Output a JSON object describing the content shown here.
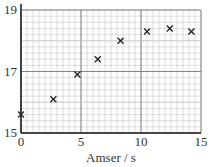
{
  "chart_data": {
    "type": "scatter",
    "title": "",
    "xlabel": "Amser / s",
    "ylabel": "",
    "xlim": [
      0,
      15
    ],
    "ylim": [
      15,
      19
    ],
    "x_ticks": [
      0,
      5,
      10,
      15
    ],
    "y_ticks": [
      15,
      17,
      19
    ],
    "grid": true,
    "legend": null,
    "marker": "x",
    "series": [
      {
        "name": "data",
        "points": [
          {
            "x": 0.0,
            "y": 15.6
          },
          {
            "x": 2.7,
            "y": 16.1
          },
          {
            "x": 4.7,
            "y": 16.9
          },
          {
            "x": 6.4,
            "y": 17.4
          },
          {
            "x": 8.3,
            "y": 18.0
          },
          {
            "x": 10.5,
            "y": 18.3
          },
          {
            "x": 12.4,
            "y": 18.4
          },
          {
            "x": 14.2,
            "y": 18.3
          }
        ]
      }
    ]
  },
  "colors": {
    "axis": "#222222",
    "major_grid": "#777777",
    "minor_grid": "#c8c8c8",
    "marker": "#222222"
  }
}
